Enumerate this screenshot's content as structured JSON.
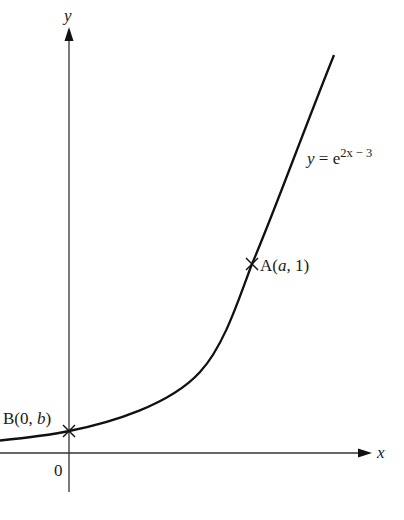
{
  "diagram": {
    "type": "function-graph",
    "axes": {
      "x_label": "x",
      "y_label": "y",
      "origin_label": "0"
    },
    "curve": {
      "label_prefix": "y = e",
      "label_exponent": "2x − 3",
      "equation": "y = e^(2x − 3)"
    },
    "points": [
      {
        "id": "A",
        "label_name": "A(",
        "label_var": "a",
        "label_rest": ", 1)",
        "full_label": "A(a, 1)"
      },
      {
        "id": "B",
        "label_name": "B(0, ",
        "label_var": "b",
        "label_rest": ")",
        "full_label": "B(0, b)"
      }
    ],
    "colors": {
      "axis": "#333333",
      "curve": "#111111",
      "text": "#1a1a1a",
      "background": "#ffffff"
    }
  }
}
